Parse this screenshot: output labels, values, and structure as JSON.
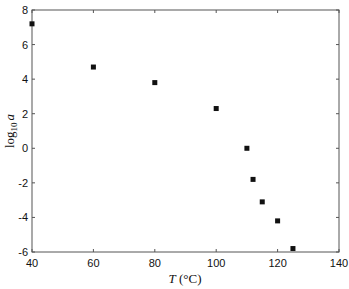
{
  "chart_data": {
    "type": "scatter",
    "title": "",
    "xlabel": "T (°C)",
    "xlabel_main": "T",
    "xlabel_unit": "(°C)",
    "ylabel": "log10 a",
    "ylabel_main": "log",
    "ylabel_sub": "10",
    "ylabel_var": "a",
    "xlim": [
      40,
      140
    ],
    "ylim": [
      -6,
      8
    ],
    "xticks": [
      40,
      60,
      80,
      100,
      120,
      140
    ],
    "yticks": [
      -6,
      -4,
      -2,
      0,
      2,
      4,
      6,
      8
    ],
    "grid": false,
    "legend": null,
    "marker": "square",
    "marker_color": "#111111",
    "series": [
      {
        "name": "log10 a",
        "x": [
          40,
          60,
          80,
          100,
          110,
          112,
          115,
          120,
          125
        ],
        "y": [
          7.2,
          4.7,
          3.8,
          2.3,
          0.0,
          -1.8,
          -3.1,
          -4.2,
          -5.8
        ]
      }
    ]
  }
}
